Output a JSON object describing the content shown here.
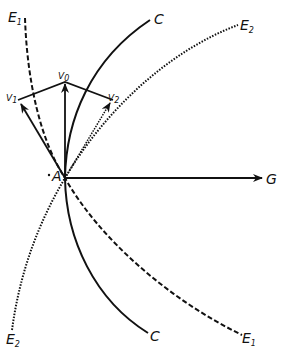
{
  "diagram": {
    "type": "vector-trajectory-diagram",
    "colors": {
      "ink": "#111111",
      "background": "#ffffff"
    },
    "point": {
      "label": "A"
    },
    "vectors": [
      {
        "id": "V0",
        "label": "V",
        "subscript": "0"
      },
      {
        "id": "V1",
        "label": "V",
        "subscript": "1"
      },
      {
        "id": "V2",
        "label": "V",
        "subscript": "2"
      },
      {
        "id": "G",
        "label": "G"
      }
    ],
    "curves": [
      {
        "id": "C",
        "style": "solid",
        "label_top": "C",
        "label_bottom": "C"
      },
      {
        "id": "E1",
        "style": "dashed",
        "label_top": "E",
        "label_top_sub": "1",
        "label_bottom": "E",
        "label_bottom_sub": "1"
      },
      {
        "id": "E2",
        "style": "dotted",
        "label_top": "E",
        "label_top_sub": "2",
        "label_bottom": "E",
        "label_bottom_sub": "2"
      }
    ]
  }
}
